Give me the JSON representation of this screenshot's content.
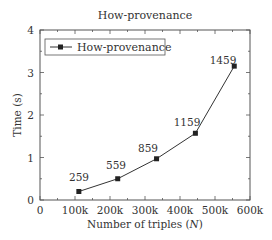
{
  "chart_data": {
    "type": "line",
    "title": "How-provenance",
    "xlabel": "Number of triples (N)",
    "xlabel_main": "Number of triples (",
    "xlabel_var": "N",
    "xlabel_end": ")",
    "ylabel": "Time (s)",
    "xlim": [
      0,
      600000
    ],
    "ylim": [
      0,
      4
    ],
    "x_ticks": [
      "0",
      "100k",
      "200k",
      "300k",
      "400k",
      "500k",
      "600k"
    ],
    "y_ticks": [
      "0",
      "1",
      "2",
      "3",
      "4"
    ],
    "grid": false,
    "legend_position": "upper left",
    "series": [
      {
        "name": "How-provenance",
        "marker": "square",
        "color": "#333333",
        "x": [
          111000,
          222000,
          333000,
          444000,
          555000
        ],
        "values": [
          0.2,
          0.5,
          0.97,
          1.57,
          3.15
        ],
        "point_labels": [
          "259",
          "559",
          "859",
          "1159",
          "1459"
        ]
      }
    ]
  }
}
